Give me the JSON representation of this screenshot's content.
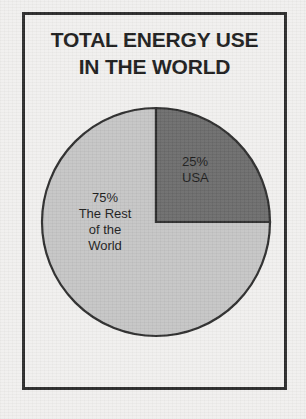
{
  "figure": {
    "title_line_1": "TOTAL ENERGY USE",
    "title_line_2": "IN THE WORLD",
    "frame_color": "#2a2a2a",
    "background_color": "#f1f0ee"
  },
  "labels": {
    "usa": {
      "percent_text": "25%",
      "name_text": "USA"
    },
    "rest": {
      "percent_text": "75%",
      "name_line_1": "The Rest",
      "name_line_2": "of the",
      "name_line_3": "World"
    }
  },
  "chart_data": {
    "type": "pie",
    "title": "TOTAL ENERGY USE IN THE WORLD",
    "subtitle": "",
    "xlabel": "",
    "ylabel": "",
    "labels": [
      "USA",
      "The Rest of the World"
    ],
    "values": [
      25,
      75
    ],
    "units": "percent",
    "colors": [
      "#6a6a6a",
      "#c4c4c4"
    ],
    "slice_outline_color": "#2b2b2b",
    "start_angle_deg": 0,
    "direction": "clockwise",
    "legend": false,
    "grid": false,
    "data_labels": [
      "25% USA",
      "75% The Rest of the World"
    ],
    "center_px": [
      156,
      222
    ],
    "radius_px": 114
  }
}
